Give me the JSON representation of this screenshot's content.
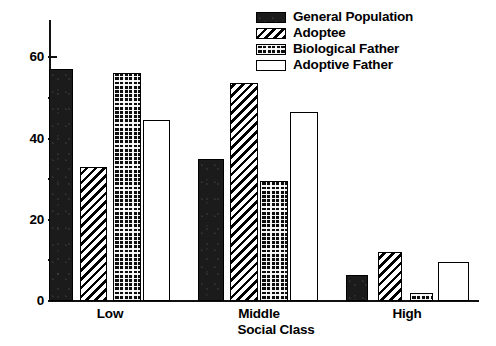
{
  "chart_data": {
    "type": "bar",
    "title": "",
    "xlabel": "Social Class",
    "ylabel": "",
    "categories": [
      "Low",
      "Middle",
      "High"
    ],
    "series": [
      {
        "name": "General Population",
        "pattern": "solid",
        "values": [
          57,
          35,
          6.5
        ]
      },
      {
        "name": "Adoptee",
        "pattern": "diagonal",
        "values": [
          33,
          53.5,
          12
        ]
      },
      {
        "name": "Biological Father",
        "pattern": "crosshatch",
        "values": [
          56,
          29.5,
          2
        ]
      },
      {
        "name": "Adoptive Father",
        "pattern": "open",
        "values": [
          44.5,
          46.5,
          9.5
        ]
      }
    ],
    "ylim": [
      0,
      65
    ],
    "y_major_ticks": [
      0,
      20,
      40,
      60
    ],
    "y_minor_ticks": [
      10,
      30,
      50
    ],
    "y_tick_labels": [
      "0",
      "20",
      "40",
      "60"
    ],
    "grid": false,
    "legend_position": "top-center"
  },
  "legend": {
    "items": [
      {
        "label": "General Population"
      },
      {
        "label": "Adoptee"
      },
      {
        "label": "Biological Father"
      },
      {
        "label": "Adoptive Father"
      }
    ]
  },
  "axes": {
    "x_title": "Social Class",
    "group_labels": [
      "Low",
      "Middle",
      "High"
    ],
    "y_labels": [
      "60",
      "40",
      "20",
      "0"
    ]
  }
}
